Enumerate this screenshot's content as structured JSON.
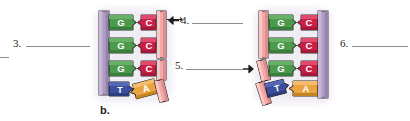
{
  "figure": {
    "caption": "b.",
    "background_color": "#ffffff",
    "line_color": "#8b8b90"
  },
  "labels": [
    {
      "id": "label-3",
      "text": "3.",
      "x": 13,
      "y": 38,
      "rule_x": 26,
      "rule_y": 46,
      "rule_w": 64,
      "arrow": "none"
    },
    {
      "id": "label-4",
      "text": "4.",
      "x": 180,
      "y": 15,
      "rule_x": 190,
      "rule_y": 23,
      "rule_w": 30,
      "arrow": "left",
      "arrow_x": 166,
      "arrow_y": 13
    },
    {
      "id": "label-5",
      "text": "5.",
      "x": 175,
      "y": 60,
      "rule_x": 186,
      "rule_y": 69,
      "rule_w": 59,
      "arrow": "right",
      "arrow_x": 244,
      "arrow_y": 60
    },
    {
      "id": "label-6",
      "text": "6.",
      "x": 340,
      "y": 38,
      "rule_x": 352,
      "rule_y": 46,
      "rule_w": 56,
      "arrow": "none"
    }
  ],
  "stub_rules": [
    {
      "id": "stub-left-edge",
      "x": 0,
      "y": 57,
      "w": 9
    },
    {
      "id": "stub-mid-upper",
      "x": 203,
      "y": 23,
      "w": 39
    },
    {
      "id": "stub-mid-lower",
      "x": 0,
      "y": 69,
      "w": 0
    }
  ],
  "colors": {
    "backbone_purple": "#b09cc4",
    "backbone_purple_dark": "#8d7aa3",
    "backbone_pink": "#f2a8a6",
    "backbone_pink_dark": "#d4807e",
    "base_g_green": "#4c9a4c",
    "base_g_green_dark": "#336b33",
    "base_c_crimson": "#cc1f47",
    "base_c_crimson_dark": "#97153a",
    "base_t_blue": "#3b4f9e",
    "base_t_blue_dark": "#2a3a76",
    "base_a_orange": "#eaa33f",
    "base_a_orange_dark": "#b77c24",
    "outline": "#1a1a1a",
    "label_text": "#231f20",
    "glow": "#e9e4ef"
  },
  "diagrams": [
    {
      "id": "diagram-left",
      "backbone_left": {
        "name": "template-strand-purple",
        "color_key": "backbone_purple"
      },
      "backbone_right_segments": [
        {
          "name": "primer-fragment-top",
          "color_key": "backbone_pink",
          "tilt": 0
        },
        {
          "name": "primer-fragment-middle",
          "color_key": "backbone_pink",
          "tilt": 0
        },
        {
          "name": "primer-fragment-bottom",
          "color_key": "backbone_pink",
          "tilt": -14
        }
      ],
      "rungs": [
        {
          "left_base": "G",
          "right_base": "C",
          "right_attached": true,
          "tilt": 0
        },
        {
          "left_base": "G",
          "right_base": "C",
          "right_attached": true,
          "tilt": 0
        },
        {
          "left_base": "G",
          "right_base": "C",
          "right_attached": true,
          "tilt": 0
        },
        {
          "left_base": "T",
          "right_base": "A",
          "right_attached": false,
          "tilt": -14
        }
      ]
    },
    {
      "id": "diagram-right",
      "backbone_right": {
        "name": "template-strand-purple",
        "color_key": "backbone_purple"
      },
      "backbone_left_segments": [
        {
          "name": "primer-fragment-top",
          "color_key": "backbone_pink",
          "tilt": 0
        },
        {
          "name": "primer-fragment-middle",
          "color_key": "backbone_pink",
          "tilt": -14
        },
        {
          "name": "primer-fragment-bottom",
          "color_key": "backbone_pink",
          "tilt": -20
        }
      ],
      "rungs": [
        {
          "left_base": "G",
          "right_base": "C",
          "left_attached": true,
          "tilt": 0
        },
        {
          "left_base": "G",
          "right_base": "C",
          "left_attached": true,
          "tilt": 0
        },
        {
          "left_base": "G",
          "right_base": "C",
          "left_attached": false,
          "tilt": 0
        },
        {
          "left_base": "T",
          "right_base": "A",
          "left_attached": false,
          "tilt": -14
        }
      ]
    }
  ],
  "base_letters": {
    "G": "G",
    "C": "C",
    "T": "T",
    "A": "A"
  }
}
